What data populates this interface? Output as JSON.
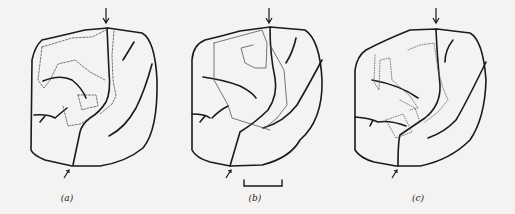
{
  "figure": {
    "panels": [
      {
        "id": "a",
        "label": "(a)",
        "trace_style": "solid-dotted"
      },
      {
        "id": "b",
        "label": "(b)",
        "trace_style": "solid-dotted"
      },
      {
        "id": "c",
        "label": "(c)",
        "trace_style": "dotted"
      }
    ],
    "scale_bar": {
      "present": true,
      "panel": "b"
    },
    "markers": {
      "top": "down-arrow",
      "bottom": "up-right-arrow"
    },
    "colors": {
      "outline": "#1a1a1a",
      "trace": "#555555",
      "background": "#f4f3f1"
    }
  }
}
